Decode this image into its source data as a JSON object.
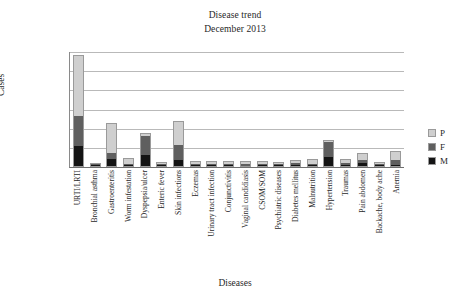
{
  "chart_data": {
    "type": "bar",
    "stacked": true,
    "title": "Disease trend",
    "subtitle": "December 2013",
    "xlabel": "Diseases",
    "ylabel": "Cases",
    "ylim": [
      0,
      600
    ],
    "yticks": [
      0,
      100,
      200,
      300,
      400,
      500,
      600
    ],
    "grid": true,
    "legend_position": "right",
    "categories": [
      "URTI/LRTI",
      "Bronchial asthma",
      "Gastroenteritis",
      "Worm infestation",
      "Dyspepsia/ulcer",
      "Enteric fever",
      "Skin infections",
      "Eczemas",
      "Urinary tract infection",
      "Conjunctivitis",
      "Vaginal candidiasis",
      "CSOM/SOM",
      "Psychiatric diseases",
      "Diabetes mellitus",
      "Malnutrition",
      "Hypertension",
      "Traumas",
      "Pain abdomen",
      "Backache, body ache",
      "Anemia"
    ],
    "series": [
      {
        "name": "M",
        "color": "#141414",
        "values": [
          105,
          4,
          35,
          5,
          57,
          4,
          32,
          3,
          4,
          2,
          0,
          3,
          3,
          7,
          3,
          47,
          5,
          15,
          4,
          4
        ]
      },
      {
        "name": "F",
        "color": "#5f5f5f",
        "values": [
          155,
          4,
          32,
          5,
          100,
          5,
          76,
          7,
          7,
          4,
          9,
          6,
          4,
          10,
          5,
          80,
          10,
          18,
          5,
          28
        ]
      },
      {
        "name": "P",
        "color": "#cfcfcf",
        "values": [
          315,
          4,
          150,
          26,
          8,
          5,
          122,
          11,
          12,
          11,
          10,
          11,
          5,
          8,
          22,
          6,
          19,
          29,
          5,
          40
        ]
      }
    ],
    "totals": [
      575,
      12,
      217,
      36,
      165,
      14,
      230,
      21,
      23,
      17,
      19,
      20,
      12,
      25,
      30,
      133,
      34,
      62,
      14,
      72
    ]
  },
  "legend": {
    "items": [
      {
        "label": "P",
        "color": "#cfcfcf"
      },
      {
        "label": "F",
        "color": "#5f5f5f"
      },
      {
        "label": "M",
        "color": "#141414"
      }
    ]
  }
}
